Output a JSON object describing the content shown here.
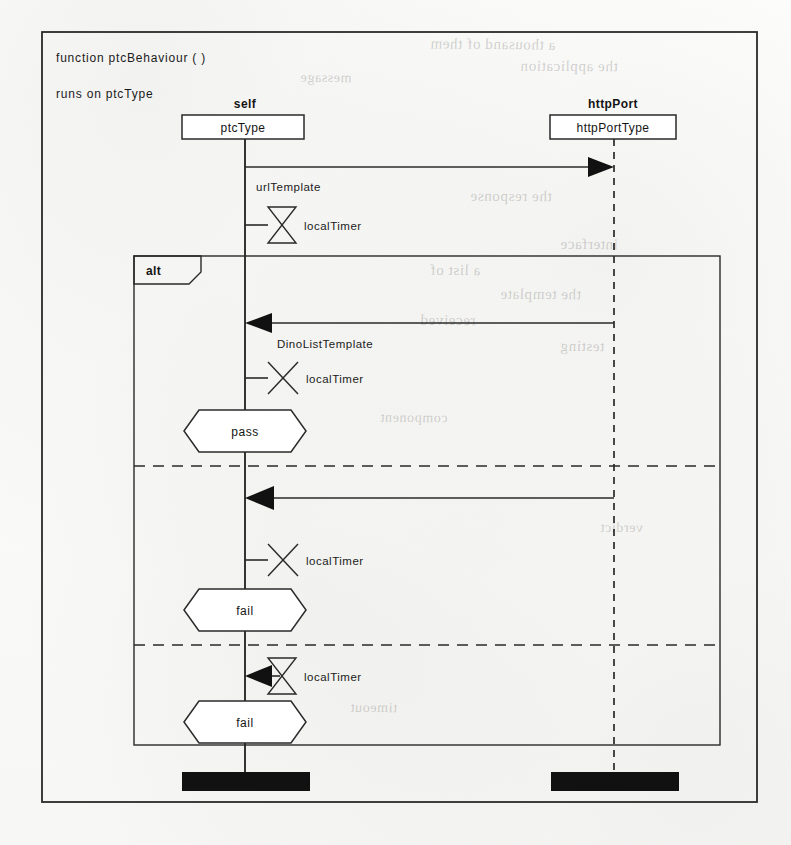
{
  "diagram": {
    "kind": "uml-sequence-diagram",
    "signature": "function  ptcBehaviour  (      )",
    "runs_on": "runs on  ptcType",
    "ink_color": "#2a2a2a",
    "paper_color": "#fbfbfa"
  },
  "lifelines": [
    {
      "id": "self",
      "name": "self",
      "type_label": "ptcType",
      "line_style": "solid",
      "x": 245,
      "terminator": "black-bar"
    },
    {
      "id": "httpPort",
      "name": "httpPort",
      "type_label": "httpPortType",
      "line_style": "dashed",
      "x": 614,
      "terminator": "black-bar"
    }
  ],
  "fragment": {
    "operator": "alt",
    "label": "alt",
    "operands": [
      {
        "index": 0,
        "verdict": "pass"
      },
      {
        "index": 1,
        "verdict": "fail"
      },
      {
        "index": 2,
        "verdict": "fail"
      }
    ]
  },
  "events": [
    {
      "seq": 1,
      "kind": "message",
      "label": "urlTemplate",
      "from": "self",
      "to": "httpPort",
      "direction": "right",
      "arrowhead": "filled",
      "y": 167
    },
    {
      "seq": 2,
      "kind": "timer-start",
      "label": "localTimer",
      "symbol": "hourglass",
      "on": "self",
      "y": 225
    },
    {
      "seq": 3,
      "kind": "message",
      "label": "DinoListTemplate",
      "from": "httpPort",
      "to": "self",
      "direction": "left",
      "arrowhead": "filled",
      "y": 323
    },
    {
      "seq": 4,
      "kind": "timer-stop",
      "label": "localTimer",
      "symbol": "cross",
      "on": "self",
      "y": 378
    },
    {
      "seq": 5,
      "kind": "verdict",
      "label": "pass",
      "on": "self",
      "y": 431
    },
    {
      "seq": 6,
      "kind": "message",
      "label": "",
      "from": "httpPort",
      "to": "self",
      "direction": "left",
      "arrowhead": "filled",
      "y": 498
    },
    {
      "seq": 7,
      "kind": "timer-stop",
      "label": "localTimer",
      "symbol": "cross",
      "on": "self",
      "y": 560
    },
    {
      "seq": 8,
      "kind": "verdict",
      "label": "fail",
      "on": "self",
      "y": 610
    },
    {
      "seq": 9,
      "kind": "timer-timeout",
      "label": "localTimer",
      "symbol": "hourglass-arrow",
      "on": "self",
      "y": 676
    },
    {
      "seq": 10,
      "kind": "verdict",
      "label": "fail",
      "on": "self",
      "y": 722
    }
  ],
  "separators": [
    {
      "index": 0,
      "y": 466
    },
    {
      "index": 1,
      "y": 645
    }
  ],
  "bleed_text": [
    {
      "text": "a thousand of them",
      "x": 430,
      "y": 36,
      "size": 15,
      "rot": -0.6
    },
    {
      "text": "the application",
      "x": 520,
      "y": 58,
      "size": 15,
      "rot": -0.4
    },
    {
      "text": "message",
      "x": 300,
      "y": 70,
      "size": 14,
      "rot": -0.5
    },
    {
      "text": "the response",
      "x": 470,
      "y": 188,
      "size": 15,
      "rot": -0.4
    },
    {
      "text": "interface",
      "x": 560,
      "y": 236,
      "size": 15,
      "rot": -0.5
    },
    {
      "text": "a list of",
      "x": 430,
      "y": 262,
      "size": 15,
      "rot": -0.4
    },
    {
      "text": "the template",
      "x": 500,
      "y": 286,
      "size": 15,
      "rot": -0.4
    },
    {
      "text": "received",
      "x": 420,
      "y": 312,
      "size": 15,
      "rot": -0.4
    },
    {
      "text": "testing",
      "x": 560,
      "y": 338,
      "size": 15,
      "rot": -0.5
    },
    {
      "text": "component",
      "x": 380,
      "y": 410,
      "size": 14,
      "rot": -0.4
    },
    {
      "text": "verdict",
      "x": 600,
      "y": 520,
      "size": 14,
      "rot": -0.4
    },
    {
      "text": "timeout",
      "x": 350,
      "y": 700,
      "size": 14,
      "rot": -0.4
    }
  ]
}
